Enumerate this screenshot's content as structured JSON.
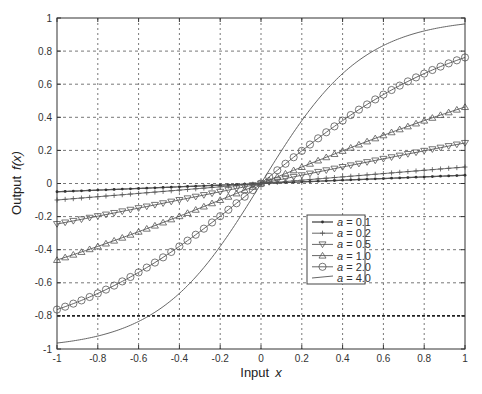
{
  "chart_data": {
    "type": "line",
    "title": "",
    "xlabel": "Input  x",
    "xlabel_parts": {
      "text": "Input",
      "var": "x"
    },
    "ylabel": "Output  f(x)",
    "ylabel_parts": {
      "text": "Output",
      "var": "f(x)"
    },
    "xlim": [
      -1,
      1
    ],
    "ylim": [
      -1,
      1
    ],
    "grid": true,
    "legend_position": "lower right (inside, near center-right)",
    "x_ticks": [
      "-1",
      "-0.8",
      "-0.6",
      "-0.4",
      "-0.2",
      "0",
      "0.2",
      "0.4",
      "0.6",
      "0.8",
      "1"
    ],
    "y_ticks": [
      "-1",
      "-0.8",
      "-0.6",
      "-0.4",
      "-0.2",
      "0",
      "0.2",
      "0.4",
      "0.6",
      "0.8",
      "1"
    ],
    "x": [
      -1,
      -0.8,
      -0.6,
      -0.4,
      -0.2,
      0,
      0.2,
      0.4,
      0.6,
      0.8,
      1
    ],
    "series": [
      {
        "name": "a = 0.1",
        "marker": "dot",
        "values": [
          -0.05,
          -0.04,
          -0.03,
          -0.02,
          -0.01,
          0,
          0.01,
          0.02,
          0.03,
          0.04,
          0.05
        ]
      },
      {
        "name": "a = 0.2",
        "marker": "plus",
        "values": [
          -0.1,
          -0.08,
          -0.06,
          -0.04,
          -0.02,
          0,
          0.02,
          0.04,
          0.06,
          0.08,
          0.1
        ]
      },
      {
        "name": "a = 0.5",
        "marker": "triangle-down",
        "values": [
          -0.245,
          -0.197,
          -0.149,
          -0.1,
          -0.05,
          0,
          0.05,
          0.1,
          0.149,
          0.197,
          0.245
        ]
      },
      {
        "name": "a = 1.0",
        "marker": "triangle-up",
        "values": [
          -0.462,
          -0.38,
          -0.291,
          -0.197,
          -0.1,
          0,
          0.1,
          0.197,
          0.291,
          0.38,
          0.462
        ]
      },
      {
        "name": "a = 2.0",
        "marker": "circle",
        "values": [
          -0.762,
          -0.664,
          -0.537,
          -0.38,
          -0.197,
          0,
          0.197,
          0.38,
          0.537,
          0.664,
          0.762
        ]
      },
      {
        "name": "a = 4.0",
        "marker": "none",
        "values": [
          -0.964,
          -0.922,
          -0.834,
          -0.664,
          -0.38,
          0,
          0.38,
          0.664,
          0.834,
          0.922,
          0.964
        ]
      }
    ],
    "function_hint": "f(x) = tanh(a*x/2)",
    "annotations": [
      "dark dashed horizontal line at y = -0.8"
    ]
  },
  "legend": {
    "items": [
      {
        "var": "a",
        "label": " = 0.1"
      },
      {
        "var": "a",
        "label": " = 0.2"
      },
      {
        "var": "a",
        "label": " = 0.5"
      },
      {
        "var": "a",
        "label": " = 1.0"
      },
      {
        "var": "a",
        "label": " = 2.0"
      },
      {
        "var": "a",
        "label": " = 4.0"
      }
    ]
  },
  "style": {
    "line_color": "#555555",
    "grid_color": "#444444",
    "axis_color": "#333333"
  }
}
